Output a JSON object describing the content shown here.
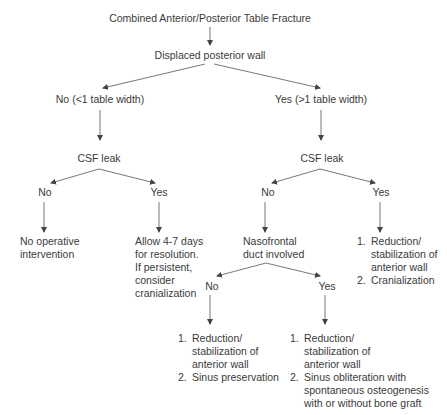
{
  "diagram": {
    "type": "flowchart",
    "root": "Combined Anterior/Posterior Table Fracture",
    "question1": "Displaced posterior wall",
    "branch_no": {
      "label": "No (<1 table width)",
      "question": "CSF leak",
      "no_label": "No",
      "no_outcome": [
        "No operative",
        "intervention"
      ],
      "yes_label": "Yes",
      "yes_outcome": [
        "Allow 4-7 days",
        "for resolution.",
        "If persistent,",
        "consider",
        "cranialization"
      ]
    },
    "branch_yes": {
      "label": "Yes (>1 table width)",
      "question": "CSF leak",
      "no_label": "No",
      "no_question": [
        "Nasofrontal",
        "duct involved"
      ],
      "yes_label": "Yes",
      "yes_outcome": [
        {
          "num": "1.",
          "lines": [
            "Reduction/",
            "stabilization of",
            "anterior wall"
          ]
        },
        {
          "num": "2.",
          "lines": [
            "Cranialization"
          ]
        }
      ],
      "duct_no_label": "No",
      "duct_no_outcome": [
        {
          "num": "1.",
          "lines": [
            "Reduction/",
            "stabilization of",
            "anterior wall"
          ]
        },
        {
          "num": "2.",
          "lines": [
            "Sinus preservation"
          ]
        }
      ],
      "duct_yes_label": "Yes",
      "duct_yes_outcome": [
        {
          "num": "1.",
          "lines": [
            "Reduction/",
            "stabilization of",
            "anterior wall"
          ]
        },
        {
          "num": "2.",
          "lines": [
            "Sinus obliteration with",
            "spontaneous osteogenesis",
            "with or without bone graft"
          ]
        }
      ]
    },
    "colors": {
      "text": "#3a3a3a",
      "lines": "#444444",
      "background": "#ffffff"
    }
  }
}
